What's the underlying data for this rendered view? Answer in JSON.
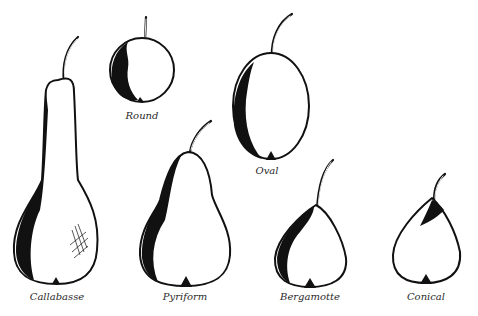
{
  "figure": {
    "shapes": [
      {
        "id": "callabasse",
        "label": "Callabasse"
      },
      {
        "id": "round",
        "label": "Round"
      },
      {
        "id": "pyriform",
        "label": "Pyriform"
      },
      {
        "id": "oval",
        "label": "Oval"
      },
      {
        "id": "bergamotte",
        "label": "Bergamotte"
      },
      {
        "id": "conical",
        "label": "Conical"
      }
    ],
    "colors": {
      "ink": "#111111",
      "background": "#ffffff",
      "label": "#2a2a2a"
    }
  }
}
